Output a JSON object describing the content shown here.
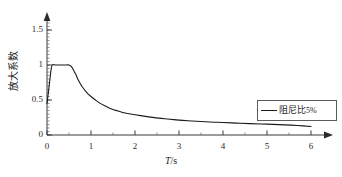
{
  "chart_data": {
    "type": "line",
    "title": "",
    "subtitle": "",
    "xlabel": "T/s",
    "xlabel_italic_part": "T",
    "xlabel_rest": "/s",
    "ylabel": "放大系数",
    "grid": false,
    "legend_position": "right-middle",
    "xlim": [
      0,
      6
    ],
    "ylim": [
      0,
      1.6
    ],
    "xticks": [
      0,
      1,
      2,
      3,
      4,
      5,
      6
    ],
    "xtick_labels": [
      "0",
      "1",
      "2",
      "3",
      "4",
      "5",
      "6"
    ],
    "yticks": [
      0,
      0.5,
      1,
      1.5
    ],
    "ytick_labels": [
      "0",
      "0.5",
      "1",
      "1.5"
    ],
    "y_minor_tick_step": 0.05,
    "x_minor_tick_step": 0.5,
    "axis_style": "arrow-ended L-axes",
    "series": [
      {
        "name": "阻尼比5%",
        "color": "#1a1a1a",
        "x": [
          0,
          0.03,
          0.06,
          0.09,
          0.12,
          0.2,
          0.3,
          0.4,
          0.5,
          0.55,
          0.6,
          0.65,
          0.7,
          0.75,
          0.8,
          0.9,
          1.0,
          1.1,
          1.2,
          1.3,
          1.4,
          1.5,
          1.6,
          1.7,
          1.8,
          1.9,
          2.0,
          2.2,
          2.4,
          2.6,
          2.8,
          3.0,
          3.2,
          3.4,
          3.6,
          3.8,
          4.0,
          4.3,
          4.6,
          5.0,
          5.4,
          5.7,
          6.0
        ],
        "y": [
          0.45,
          0.6,
          0.76,
          0.92,
          1.0,
          1.0,
          1.0,
          1.0,
          1.0,
          0.98,
          0.93,
          0.87,
          0.8,
          0.74,
          0.69,
          0.61,
          0.55,
          0.5,
          0.455,
          0.42,
          0.39,
          0.365,
          0.345,
          0.325,
          0.31,
          0.3,
          0.29,
          0.27,
          0.252,
          0.237,
          0.224,
          0.213,
          0.204,
          0.196,
          0.189,
          0.183,
          0.178,
          0.17,
          0.163,
          0.155,
          0.145,
          0.135,
          0.122
        ]
      }
    ],
    "legend_entries": [
      {
        "label": "阻尼比5%",
        "label_text": "阻尼比",
        "label_pct": "5%",
        "marker": "line",
        "color": "#1a1a1a"
      }
    ]
  },
  "axes_geometry": {
    "origin_x": 47,
    "origin_y": 135,
    "x_per_unit": 44,
    "y_per_unit": 70
  }
}
